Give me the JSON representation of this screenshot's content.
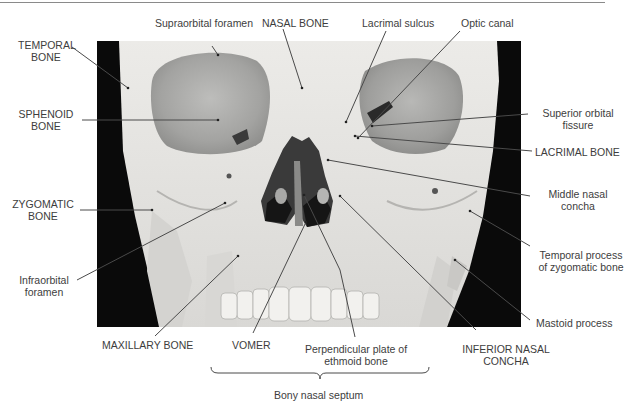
{
  "figure": {
    "labels": {
      "supraorbital_foramen": "Supraorbital foramen",
      "nasal_bone": "NASAL BONE",
      "lacrimal_sulcus": "Lacrimal sulcus",
      "optic_canal": "Optic canal",
      "temporal_bone_1": "TEMPORAL",
      "temporal_bone_2": "BONE",
      "sphenoid_bone_1": "SPHENOID",
      "sphenoid_bone_2": "BONE",
      "superior_orbital_fissure_1": "Superior orbital",
      "superior_orbital_fissure_2": "fissure",
      "lacrimal_bone": "LACRIMAL BONE",
      "zygomatic_bone_1": "ZYGOMATIC",
      "zygomatic_bone_2": "BONE",
      "middle_nasal_concha_1": "Middle nasal",
      "middle_nasal_concha_2": "concha",
      "infraorbital_foramen_1": "Infraorbital",
      "infraorbital_foramen_2": "foramen",
      "temporal_process_1": "Temporal process",
      "temporal_process_2": "of zygomatic bone",
      "mastoid_process": "Mastoid process",
      "maxillary_bone": "MAXILLARY BONE",
      "vomer": "VOMER",
      "perpendicular_plate_1": "Perpendicular plate of",
      "perpendicular_plate_2": "ethmoid bone",
      "inferior_nasal_concha_1": "INFERIOR NASAL",
      "inferior_nasal_concha_2": "CONCHA",
      "bony_nasal_septum": "Bony nasal septum"
    },
    "colors": {
      "bone": "#e6e6e4",
      "shadow": "#9a9a98",
      "background_photo": "#0a0a0a",
      "leader_line": "#4a4a4a",
      "text": "#3d3d3d"
    }
  }
}
